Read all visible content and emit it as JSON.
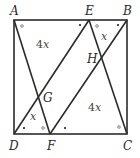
{
  "diagram": {
    "type": "geometry-square",
    "points": {
      "A": {
        "label": "A",
        "x": 14,
        "y": 20
      },
      "E": {
        "label": "E",
        "x": 89,
        "y": 20
      },
      "B": {
        "label": "B",
        "x": 127,
        "y": 20
      },
      "D": {
        "label": "D",
        "x": 14,
        "y": 134
      },
      "F": {
        "label": "F",
        "x": 50,
        "y": 134
      },
      "C": {
        "label": "C",
        "x": 127,
        "y": 134
      },
      "G": {
        "label": "G",
        "x": 38,
        "y": 96
      },
      "H": {
        "label": "H",
        "x": 101,
        "y": 58
      }
    },
    "segments": [
      "A-B",
      "B-C",
      "C-D",
      "D-A",
      "A-F",
      "E-D",
      "E-C",
      "B-F"
    ],
    "area_labels": [
      {
        "id": "top-left",
        "coef": "4",
        "var": "x"
      },
      {
        "id": "top-right",
        "coef": "",
        "var": "x"
      },
      {
        "id": "bottom-right",
        "coef": "4",
        "var": "x"
      },
      {
        "id": "bottom-left",
        "coef": "",
        "var": "x"
      }
    ],
    "angle_marks": {
      "dot": "•",
      "circle": "∘"
    },
    "colors": {
      "line": "#2b2b2b",
      "text": "#2a2a2a"
    }
  }
}
